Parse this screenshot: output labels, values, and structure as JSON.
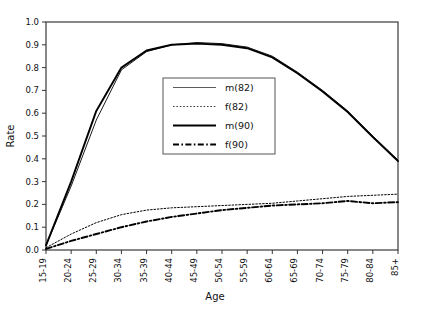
{
  "chart_data": {
    "type": "line",
    "title": "",
    "xlabel": "Age",
    "ylabel": "Rate",
    "ylim": [
      0.0,
      1.0
    ],
    "ytick_labels": [
      "0.0",
      "0.1",
      "0.2",
      "0.3",
      "0.4",
      "0.5",
      "0.6",
      "0.7",
      "0.8",
      "0.9",
      "1.0"
    ],
    "ytick_values": [
      0.0,
      0.1,
      0.2,
      0.3,
      0.4,
      0.5,
      0.6,
      0.7,
      0.8,
      0.9,
      1.0
    ],
    "grid": false,
    "legend_position": "center",
    "categories": [
      "15-19",
      "20-24",
      "25-29",
      "30-34",
      "35-39",
      "40-44",
      "45-49",
      "50-54",
      "55-59",
      "60-64",
      "65-69",
      "70-74",
      "75-79",
      "80-84",
      "85+"
    ],
    "series": [
      {
        "name": "m(82)",
        "style": "solid-thin",
        "values": [
          0.02,
          0.28,
          0.57,
          0.79,
          0.87,
          0.9,
          0.91,
          0.905,
          0.89,
          0.85,
          0.78,
          0.7,
          0.61,
          0.5,
          0.395
        ]
      },
      {
        "name": "f(82)",
        "style": "dotted",
        "values": [
          0.01,
          0.07,
          0.12,
          0.155,
          0.175,
          0.185,
          0.19,
          0.195,
          0.2,
          0.205,
          0.215,
          0.225,
          0.235,
          0.24,
          0.245
        ]
      },
      {
        "name": "m(90)",
        "style": "solid-thick",
        "values": [
          0.02,
          0.3,
          0.61,
          0.8,
          0.875,
          0.9,
          0.905,
          0.9,
          0.885,
          0.845,
          0.775,
          0.695,
          0.605,
          0.495,
          0.39
        ]
      },
      {
        "name": "f(90)",
        "style": "dash-dot",
        "values": [
          0.005,
          0.04,
          0.07,
          0.1,
          0.125,
          0.145,
          0.16,
          0.175,
          0.185,
          0.195,
          0.2,
          0.205,
          0.215,
          0.205,
          0.21
        ]
      }
    ]
  },
  "legend": {
    "entries": [
      {
        "label": "m(82)"
      },
      {
        "label": "f(82)"
      },
      {
        "label": "m(90)"
      },
      {
        "label": "f(90)"
      }
    ]
  }
}
